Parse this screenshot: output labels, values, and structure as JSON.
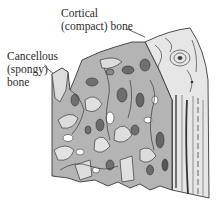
{
  "figure": {
    "labels": {
      "cortical": {
        "line1": "Cortical",
        "line2": "(compact) bone"
      },
      "cancellous": {
        "line1": "Cancellous",
        "line2": "(spongy)",
        "line3": "bone"
      }
    }
  },
  "colors": {
    "outline": "#3a3a3a",
    "trabecula_light": "#d8d8d8",
    "trabecula_mid": "#a8a8a8",
    "cavity_dark": "#6e6e6e",
    "cortical_fill": "#e6e6e6",
    "text": "#2a2a2a"
  }
}
